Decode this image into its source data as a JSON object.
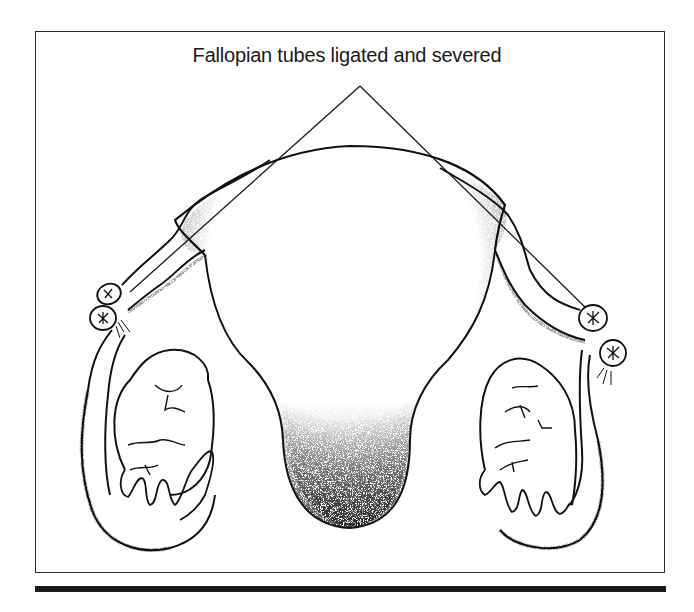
{
  "figure": {
    "label": "Fallopian tubes ligated and severed",
    "parts": {
      "uterus": "uterus",
      "left_tube": "left fallopian tube",
      "right_tube": "right fallopian tube",
      "left_ovary": "left ovary",
      "right_ovary": "right ovary",
      "ligature_marks": "ligated tube ends"
    },
    "colors": {
      "ink": "#1a1a1a",
      "background": "#ffffff"
    }
  }
}
